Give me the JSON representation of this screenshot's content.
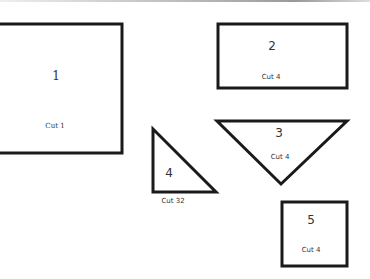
{
  "pattern": {
    "pieces": [
      {
        "id": "piece-1",
        "shape": "rectangle",
        "number": "1",
        "cut": "Cut 1"
      },
      {
        "id": "piece-2",
        "shape": "rectangle",
        "number": "2",
        "cut": "Cut 4"
      },
      {
        "id": "piece-3",
        "shape": "triangle",
        "number": "3",
        "cut": "Cut 4"
      },
      {
        "id": "piece-4",
        "shape": "right-triangle",
        "number": "4",
        "cut": "Cut 32"
      },
      {
        "id": "piece-5",
        "shape": "square",
        "number": "5",
        "cut": "Cut 4"
      }
    ],
    "stroke_color": "#1a1a1a"
  }
}
